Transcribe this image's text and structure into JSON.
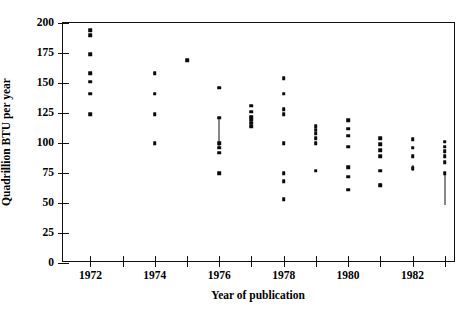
{
  "chart_data": {
    "type": "scatter",
    "title": "",
    "xlabel": "Year of publication",
    "ylabel": "Quadrillion BTU per year",
    "xlim": [
      1971.15,
      1983.35
    ],
    "ylim": [
      0,
      200
    ],
    "grid": false,
    "legend": "none",
    "xticks": [
      1972,
      1973,
      1974,
      1975,
      1976,
      1977,
      1978,
      1979,
      1980,
      1981,
      1982,
      1983
    ],
    "xticklabels": [
      "1972",
      "",
      "1974",
      "",
      "1976",
      "",
      "1978",
      "",
      "1980",
      "",
      "1982",
      ""
    ],
    "xtick_major_labels": [
      "1972",
      "1974",
      "1976",
      "1978",
      "1980",
      "1982"
    ],
    "yticks": [
      0,
      25,
      50,
      75,
      100,
      125,
      150,
      175,
      200
    ],
    "yticklabels": [
      "0",
      "25",
      "50",
      "75",
      "100",
      "125",
      "150",
      "175",
      "200"
    ],
    "points": [
      {
        "x": 1972,
        "y": 194
      },
      {
        "x": 1972,
        "y": 190
      },
      {
        "x": 1972,
        "y": 174
      },
      {
        "x": 1972,
        "y": 158
      },
      {
        "x": 1972,
        "y": 151
      },
      {
        "x": 1972,
        "y": 141
      },
      {
        "x": 1972,
        "y": 124
      },
      {
        "x": 1974,
        "y": 158
      },
      {
        "x": 1974,
        "y": 141
      },
      {
        "x": 1974,
        "y": 124
      },
      {
        "x": 1974,
        "y": 100
      },
      {
        "x": 1975,
        "y": 169
      },
      {
        "x": 1976,
        "y": 146
      },
      {
        "x": 1976,
        "y": 121
      },
      {
        "x": 1976,
        "y": 100
      },
      {
        "x": 1976,
        "y": 96
      },
      {
        "x": 1976,
        "y": 92
      },
      {
        "x": 1976,
        "y": 75
      },
      {
        "x": 1977,
        "y": 131
      },
      {
        "x": 1977,
        "y": 126
      },
      {
        "x": 1977,
        "y": 122
      },
      {
        "x": 1977,
        "y": 120
      },
      {
        "x": 1977,
        "y": 117
      },
      {
        "x": 1977,
        "y": 114
      },
      {
        "x": 1978,
        "y": 154
      },
      {
        "x": 1978,
        "y": 141
      },
      {
        "x": 1978,
        "y": 128
      },
      {
        "x": 1978,
        "y": 124
      },
      {
        "x": 1978,
        "y": 100
      },
      {
        "x": 1978,
        "y": 75
      },
      {
        "x": 1978,
        "y": 68
      },
      {
        "x": 1978,
        "y": 53
      },
      {
        "x": 1979,
        "y": 114
      },
      {
        "x": 1979,
        "y": 111
      },
      {
        "x": 1979,
        "y": 108
      },
      {
        "x": 1979,
        "y": 104
      },
      {
        "x": 1979,
        "y": 100
      },
      {
        "x": 1979,
        "y": 77
      },
      {
        "x": 1980,
        "y": 119
      },
      {
        "x": 1980,
        "y": 112
      },
      {
        "x": 1980,
        "y": 106
      },
      {
        "x": 1980,
        "y": 97
      },
      {
        "x": 1980,
        "y": 80
      },
      {
        "x": 1980,
        "y": 72
      },
      {
        "x": 1980,
        "y": 61
      },
      {
        "x": 1981,
        "y": 104
      },
      {
        "x": 1981,
        "y": 99
      },
      {
        "x": 1981,
        "y": 94
      },
      {
        "x": 1981,
        "y": 89
      },
      {
        "x": 1981,
        "y": 77
      },
      {
        "x": 1981,
        "y": 65
      },
      {
        "x": 1982,
        "y": 103
      },
      {
        "x": 1982,
        "y": 96
      },
      {
        "x": 1982,
        "y": 89
      },
      {
        "x": 1982,
        "y": 79
      },
      {
        "x": 1983,
        "y": 101
      },
      {
        "x": 1983,
        "y": 97
      },
      {
        "x": 1983,
        "y": 93
      },
      {
        "x": 1983,
        "y": 89
      },
      {
        "x": 1983,
        "y": 84
      },
      {
        "x": 1983,
        "y": 75
      }
    ],
    "error_bars": [
      {
        "x": 1976,
        "low": 95,
        "high": 121
      },
      {
        "x": 1977,
        "low": 114,
        "high": 123
      },
      {
        "x": 1981,
        "low": 63,
        "high": 67
      },
      {
        "x": 1982,
        "low": 77,
        "high": 82
      },
      {
        "x": 1983,
        "low": 48,
        "high": 74
      }
    ]
  },
  "axes": {
    "xlabel": "Year of publication",
    "ylabel": "Quadrillion BTU per year"
  }
}
